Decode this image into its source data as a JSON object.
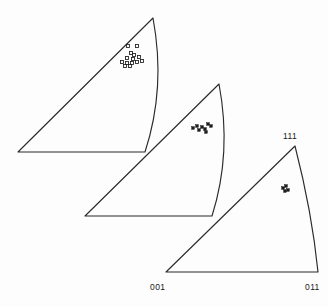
{
  "figure": {
    "background_color": "#fdfdfd",
    "line_color": "#2b2b2b",
    "marker_color": "#1c1c1c",
    "canvas": {
      "width": 328,
      "height": 307
    }
  },
  "labels": {
    "apex": "111",
    "bottom_left": "001",
    "bottom_right": "011"
  },
  "chart_data": {
    "type": "scatter",
    "xlabel": "",
    "ylabel": "",
    "grid": false,
    "legend": "none",
    "axis_labels": [
      "001",
      "011",
      "111"
    ],
    "panels": [
      {
        "name": "triangle-1",
        "index": 1,
        "labeled": false,
        "vertices": {
          "apex_111": [
            153,
            18
          ],
          "corner_001": [
            18,
            152
          ],
          "corner_011": [
            145,
            152
          ]
        },
        "arc_control": [
          166,
          88
        ],
        "marker_style": "open-square",
        "point_count": 14,
        "spread": "loose",
        "points": [
          [
            128,
            46
          ],
          [
            137,
            46
          ],
          [
            131,
            53
          ],
          [
            134,
            55
          ],
          [
            127,
            58
          ],
          [
            133,
            59
          ],
          [
            139,
            57
          ],
          [
            122,
            62
          ],
          [
            127,
            63
          ],
          [
            132,
            63
          ],
          [
            137,
            62
          ],
          [
            142,
            61
          ],
          [
            125,
            66
          ],
          [
            130,
            66
          ]
        ]
      },
      {
        "name": "triangle-2",
        "index": 2,
        "labeled": false,
        "vertices": {
          "apex_111": [
            219,
            84
          ],
          "corner_001": [
            85,
            216
          ],
          "corner_011": [
            212,
            216
          ]
        },
        "arc_control": [
          232,
          153
        ],
        "marker_style": "solid-square",
        "point_count": 8,
        "spread": "tight",
        "points": [
          [
            193,
            128
          ],
          [
            197,
            126
          ],
          [
            199,
            130
          ],
          [
            202,
            127
          ],
          [
            205,
            129
          ],
          [
            208,
            124
          ],
          [
            211,
            126
          ],
          [
            206,
            132
          ]
        ]
      },
      {
        "name": "triangle-3",
        "index": 3,
        "labeled": true,
        "vertices": {
          "apex_111": [
            295,
            146
          ],
          "corner_001": [
            166,
            272
          ],
          "corner_011": [
            318,
            272
          ]
        },
        "arc_control": [
          312,
          212
        ],
        "marker_style": "solid-square",
        "point_count": 4,
        "spread": "very-tight",
        "points": [
          [
            283,
            188
          ],
          [
            286,
            186
          ],
          [
            288,
            190
          ],
          [
            285,
            191
          ]
        ]
      }
    ]
  }
}
